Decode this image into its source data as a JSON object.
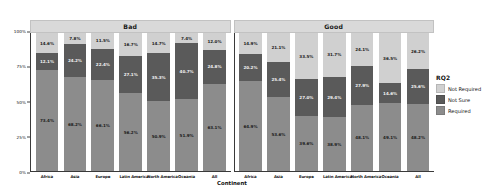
{
  "chart_data": {
    "type": "bar",
    "subtype": "stacked-percent-grouped",
    "title": "",
    "xlabel": "Continent",
    "ylabel": "",
    "ylim": [
      0,
      100
    ],
    "ytick_labels": [
      "0%",
      "25%",
      "50%",
      "75%",
      "100%"
    ],
    "ytick_values": [
      0,
      25,
      50,
      75,
      100
    ],
    "grid": false,
    "legend": {
      "title": "RQ2",
      "position": "right",
      "entries": [
        {
          "label": "Not Required",
          "color": "#d0d0d0"
        },
        {
          "label": "Not Sure",
          "color": "#5a5a5a"
        },
        {
          "label": "Required",
          "color": "#8c8c8c"
        }
      ]
    },
    "panels": [
      {
        "label": "Bad",
        "categories": [
          "Africa",
          "Asia",
          "Europe",
          "Latin America",
          "North America",
          "Oceania",
          "All"
        ],
        "series": [
          {
            "name": "Required",
            "color": "#8c8c8c",
            "values": [
              73.4,
              68.2,
              66.1,
              56.2,
              50.9,
              51.9,
              63.1
            ]
          },
          {
            "name": "Not Sure",
            "color": "#5a5a5a",
            "values": [
              12.1,
              24.2,
              22.4,
              27.1,
              35.3,
              40.7,
              24.8
            ]
          },
          {
            "name": "Not Required",
            "color": "#d0d0d0",
            "values": [
              14.6,
              7.8,
              11.5,
              16.7,
              14.7,
              7.4,
              12.0
            ]
          }
        ]
      },
      {
        "label": "Good",
        "categories": [
          "Africa",
          "Asia",
          "Europe",
          "Latin America",
          "North America",
          "Oceania",
          "All"
        ],
        "series": [
          {
            "name": "Required",
            "color": "#8c8c8c",
            "values": [
              64.9,
              53.6,
              39.6,
              38.9,
              48.1,
              49.1,
              48.2
            ]
          },
          {
            "name": "Not Sure",
            "color": "#5a5a5a",
            "values": [
              20.2,
              25.4,
              27.0,
              29.4,
              27.9,
              14.6,
              25.6
            ]
          },
          {
            "name": "Not Required",
            "color": "#d0d0d0",
            "values": [
              14.9,
              21.1,
              33.5,
              31.7,
              24.1,
              36.5,
              26.2
            ]
          }
        ]
      }
    ]
  }
}
